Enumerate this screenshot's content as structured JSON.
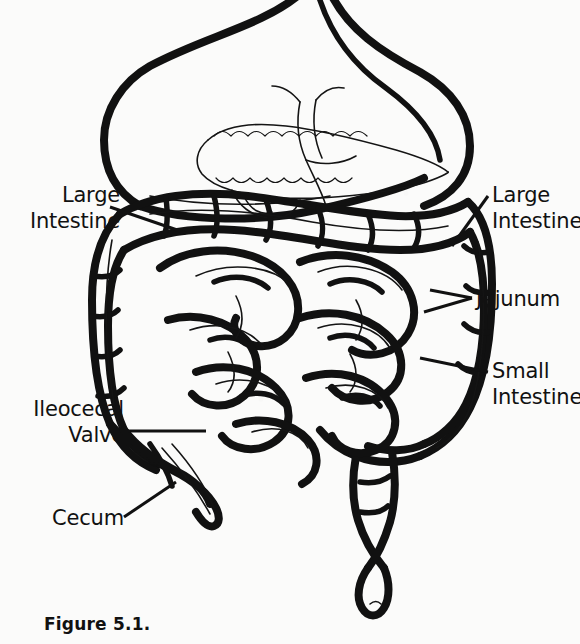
{
  "figure": {
    "caption": "Figure 5.1.",
    "ink_color": "#111111",
    "background_color": "#fbfbfa"
  },
  "labels": {
    "large_intestine_left": "Large\nIntestine",
    "ileocecal_valve": "Ileocecal\nValve",
    "cecum": "Cecum",
    "large_intestine_right": "Large\nIntestine",
    "jejunum": "Jejunum",
    "small_intestine": "Small\nIntestine"
  },
  "structures": [
    {
      "name": "stomach",
      "label": ""
    },
    {
      "name": "pancreas",
      "label": ""
    },
    {
      "name": "duodenum",
      "label": ""
    },
    {
      "name": "transverse-colon",
      "label": ""
    },
    {
      "name": "ascending-colon",
      "label": ""
    },
    {
      "name": "descending-colon",
      "label": ""
    },
    {
      "name": "sigmoid-colon",
      "label": ""
    },
    {
      "name": "rectum",
      "label": ""
    },
    {
      "name": "cecum",
      "label": ""
    },
    {
      "name": "appendix",
      "label": ""
    },
    {
      "name": "small-intestine-coils",
      "label": ""
    }
  ]
}
